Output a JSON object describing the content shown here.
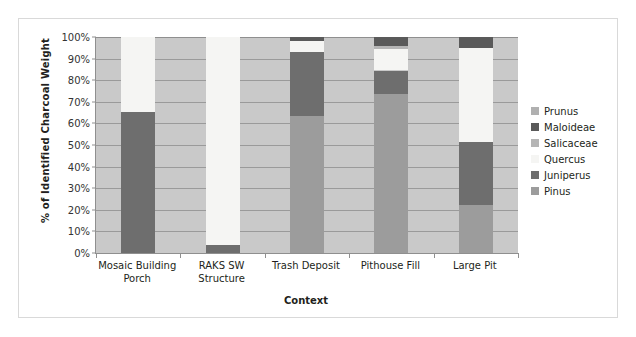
{
  "chart_data": {
    "type": "bar",
    "subtype": "stacked-100-percent",
    "title": "",
    "xlabel": "Context",
    "ylabel": "% of Identified Charcoal Weight",
    "ylim": [
      0,
      100
    ],
    "ytick_labels": [
      "100%",
      "90%",
      "80%",
      "70%",
      "60%",
      "50%",
      "40%",
      "30%",
      "20%",
      "10%",
      "0%"
    ],
    "ytick_values": [
      100,
      90,
      80,
      70,
      60,
      50,
      40,
      30,
      20,
      10,
      0
    ],
    "grid": true,
    "legend_position": "right",
    "categories": [
      "Mosaic Building Porch",
      "RAKS SW Structure",
      "Trash Deposit",
      "Pithouse Fill",
      "Large Pit"
    ],
    "category_lines": [
      [
        "Mosaic Building",
        "Porch"
      ],
      [
        "RAKS SW",
        "Structure"
      ],
      [
        "Trash Deposit"
      ],
      [
        "Pithouse Fill"
      ],
      [
        "Large Pit"
      ]
    ],
    "series": [
      {
        "name": "Pinus",
        "color": "#9c9c9c",
        "values": [
          0,
          0,
          63.5,
          73.5,
          22.0
        ]
      },
      {
        "name": "Juniperus",
        "color": "#6e6e6e",
        "values": [
          65.5,
          3.5,
          29.5,
          11.0,
          29.5
        ]
      },
      {
        "name": "Quercus",
        "color": "#f5f5f3",
        "values": [
          34.5,
          96.5,
          5.0,
          10.0,
          43.5
        ]
      },
      {
        "name": "Salicaceae",
        "color": "#b5b5b5",
        "values": [
          0,
          0,
          0,
          1.5,
          0
        ]
      },
      {
        "name": "Maloideae",
        "color": "#5a5a5a",
        "values": [
          0,
          0,
          2.0,
          4.0,
          5.0
        ]
      },
      {
        "name": "Prunus",
        "color": "#b0b0b0",
        "values": [
          0,
          0,
          0,
          0,
          0
        ]
      }
    ],
    "legend": [
      {
        "label": "Prunus",
        "color": "#b0b0b0"
      },
      {
        "label": "Maloideae",
        "color": "#5a5a5a"
      },
      {
        "label": "Salicaceae",
        "color": "#b5b5b5"
      },
      {
        "label": "Quercus",
        "color": "#f5f5f3"
      },
      {
        "label": "Juniperus",
        "color": "#6e6e6e"
      },
      {
        "label": "Pinus",
        "color": "#9c9c9c"
      }
    ],
    "plot_background": "#c9c9c9",
    "stack_order_bottom_to_top": [
      "Pinus",
      "Juniperus",
      "Quercus",
      "Salicaceae",
      "Maloideae",
      "Prunus"
    ]
  }
}
